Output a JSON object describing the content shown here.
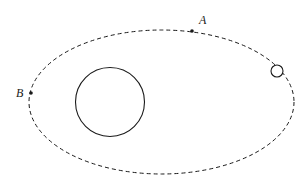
{
  "diagram": {
    "colors": {
      "stroke": "#1a1a1a",
      "background": "#ffffff"
    },
    "orbit": {
      "style": "dashed",
      "cx": 161.5,
      "cy": 102,
      "rx": 132.5,
      "ry": 72
    },
    "planet": {
      "cx": 110,
      "cy": 102,
      "r": 34.5
    },
    "satellite": {
      "cx": 277,
      "cy": 71,
      "r": 6
    },
    "points": [
      {
        "id": "A",
        "label": "A",
        "x": 192,
        "y": 31,
        "label_x": 199,
        "label_y": 24
      },
      {
        "id": "B",
        "label": "B",
        "x": 31,
        "y": 93,
        "label_x": 16,
        "label_y": 97
      }
    ]
  }
}
